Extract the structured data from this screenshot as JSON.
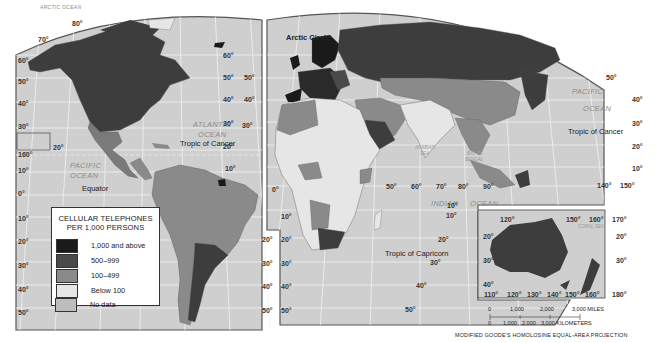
{
  "map": {
    "title": "Cellular Telephones per 1,000 Persons",
    "projection": "MODIFIED GOODE'S HOMOLOSINE EQUAL-AREA PROJECTION",
    "colors": {
      "ocean": "#cfcfcf",
      "graticule": "#f2f2f2",
      "border": "#555555",
      "class_1000_plus": "#1a1a1a",
      "class_500_999": "#4a4a4a",
      "class_100_499": "#8a8a8a",
      "class_below_100": "#e6e6e6",
      "class_no_data": "#bdbdbd"
    }
  },
  "legend": {
    "title_line1": "CELLULAR TELEPHONES",
    "title_line2": "PER 1,000 PERSONS",
    "items": [
      {
        "label": "1,000 and above",
        "color": "#1a1a1a"
      },
      {
        "label": "500–999",
        "color": "#4a4a4a"
      },
      {
        "label": "100–499",
        "color": "#8a8a8a"
      },
      {
        "label": "Below 100",
        "color": "#e6e6e6"
      },
      {
        "label": "No data",
        "color": "#bdbdbd"
      }
    ]
  },
  "labels": {
    "oceans": {
      "arctic": "ARCTIC OCEAN",
      "atlantic_1": "ATLANTIC",
      "atlantic_2": "OCEAN",
      "pacific_w_1": "PACIFIC",
      "pacific_w_2": "OCEAN",
      "pacific_e_1": "PACIFIC",
      "pacific_e_2": "OCEAN",
      "indian_1": "INDIAN",
      "indian_2": "OCEAN",
      "arabian_sea_1": "ARABIAN",
      "arabian_sea_2": "SEA",
      "bay_of_bengal_1": "BAY OF",
      "bay_of_bengal_2": "BENGAL",
      "coral_sea": "CORAL SEA"
    },
    "lines": {
      "arctic_circle": "Arctic Circle",
      "tropic_of_cancer_w": "Tropic of Cancer",
      "tropic_of_cancer_e": "Tropic of Cancer",
      "equator": "Equator",
      "tropic_of_capricorn": "Tropic of Capricorn"
    },
    "latitudes_left": [
      "80°",
      "70°",
      "60°",
      "50°",
      "40°",
      "30°",
      "20°",
      "160°",
      "10°",
      "0°",
      "10°",
      "20°",
      "30°",
      "40°",
      "50°"
    ],
    "latitudes_mid_left": [
      "60°",
      "50°",
      "40°",
      "30°",
      "20°",
      "10°",
      "20°",
      "30°",
      "40°",
      "50°"
    ],
    "latitudes_mid_right": [
      "50°",
      "40°",
      "30°",
      "0°",
      "10°",
      "20°",
      "30°",
      "40°",
      "50°"
    ],
    "indian_longitudes": [
      "50°",
      "60°",
      "70°",
      "80°",
      "90°"
    ],
    "indian_lats": [
      "10°",
      "10°",
      "20°",
      "30°",
      "40°",
      "50°"
    ],
    "east_lats": [
      "50°",
      "40°",
      "30°",
      "20°",
      "10°"
    ],
    "east_longs": [
      "140°",
      "150°"
    ],
    "australia": {
      "top_longs": [
        "120°",
        "150°",
        "160°",
        "170°"
      ],
      "bottom_longs": [
        "110°",
        "120°",
        "130°",
        "140°",
        "150°",
        "160°",
        "180°"
      ],
      "lats_left": [
        "20°",
        "30°",
        "40°"
      ],
      "lats_right": [
        "20°",
        "30°"
      ]
    }
  },
  "scale": {
    "miles_ticks": [
      "0",
      "1,000",
      "2,000",
      "3,000 MILES"
    ],
    "km_ticks": [
      "0",
      "1,000",
      "2,000",
      "3,000 KILOMETERS"
    ]
  }
}
